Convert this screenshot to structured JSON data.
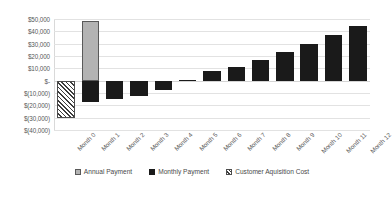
{
  "chart_data": {
    "type": "bar",
    "title": "",
    "subtitle": "",
    "xlabel": "",
    "ylabel": "",
    "grid": true,
    "legend_position": "bottom",
    "categories": [
      "Month 0",
      "Month 1",
      "Month 2",
      "Month 3",
      "Month 4",
      "Month 5",
      "Month 6",
      "Month 7",
      "Month 8",
      "Month 9",
      "Month 10",
      "Month 11",
      "Month 12"
    ],
    "ylim": [
      -40000,
      50000
    ],
    "ytick_values": [
      50000,
      40000,
      30000,
      20000,
      10000,
      0,
      -10000,
      -20000,
      -30000,
      -40000
    ],
    "ytick_labels": [
      "$50,000",
      "$40,000",
      "$30,000",
      "$20,000",
      "$10,000",
      "$-",
      "$(10,000)",
      "$(20,000)",
      "$(30,000)",
      "$(40,000)"
    ],
    "series": [
      {
        "name": "Annual Payment",
        "color": "#b3b3b3",
        "values": [
          null,
          48000,
          null,
          null,
          null,
          null,
          null,
          null,
          null,
          null,
          null,
          null,
          null
        ]
      },
      {
        "name": "Monthly Payment",
        "color": "#1a1a1a",
        "values": [
          null,
          -17500,
          -15000,
          -12500,
          -7500,
          500,
          7500,
          11000,
          17000,
          23000,
          30000,
          37000,
          44000
        ]
      },
      {
        "name": "Customer Aquisition Cost",
        "color": "#ffffff",
        "values": [
          -30000,
          null,
          null,
          null,
          null,
          null,
          null,
          null,
          null,
          null,
          null,
          null,
          null
        ]
      }
    ]
  },
  "legend": {
    "items": [
      {
        "label": "Annual Payment",
        "swatch": "annual-swatch"
      },
      {
        "label": "Monthly Payment",
        "swatch": "monthly-swatch"
      },
      {
        "label": "Customer Aquisition Cost",
        "swatch": "cac-swatch"
      }
    ]
  }
}
